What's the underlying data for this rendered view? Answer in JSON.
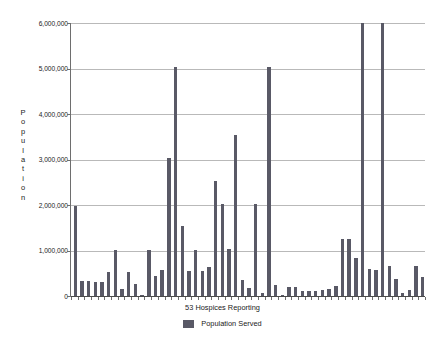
{
  "chart_data": {
    "type": "bar",
    "title": "",
    "subtitle": "",
    "xlabel": "53 Hospices Reporting",
    "ylabel": "Population",
    "ylim": [
      0,
      6000000
    ],
    "ytick_values": [
      0,
      1000000,
      2000000,
      3000000,
      4000000,
      5000000,
      6000000
    ],
    "ytick_labels": [
      "0",
      "1,000,000",
      "2,000,000",
      "3,000,000",
      "4,000,000",
      "5,000,000",
      "6,000,000"
    ],
    "xtick_labels": [],
    "grid": true,
    "legend_position": "bottom-center",
    "bar_color": "#595966",
    "gridline_color": "#b9b9b9",
    "axis_color": "#4a4a4a",
    "series": [
      {
        "name": "Population Served",
        "values": [
          1980000,
          320000,
          320000,
          310000,
          310000,
          520000,
          1010000,
          160000,
          520000,
          260000,
          20000,
          1010000,
          440000,
          580000,
          3030000,
          5030000,
          1530000,
          540000,
          1020000,
          540000,
          630000,
          2530000,
          2030000,
          1030000,
          3530000,
          350000,
          180000,
          2030000,
          60000,
          5040000,
          240000,
          30000,
          190000,
          190000,
          120000,
          110000,
          110000,
          140000,
          150000,
          230000,
          1250000,
          1250000,
          840000,
          6200000,
          590000,
          570000,
          6200000,
          670000,
          370000,
          60000,
          130000,
          650000,
          420000
        ]
      }
    ],
    "categories": [
      "1",
      "2",
      "3",
      "4",
      "5",
      "6",
      "7",
      "8",
      "9",
      "10",
      "11",
      "12",
      "13",
      "14",
      "15",
      "16",
      "17",
      "18",
      "19",
      "20",
      "21",
      "22",
      "23",
      "24",
      "25",
      "26",
      "27",
      "28",
      "29",
      "30",
      "31",
      "32",
      "33",
      "34",
      "35",
      "36",
      "37",
      "38",
      "39",
      "40",
      "41",
      "42",
      "43",
      "44",
      "45",
      "46",
      "47",
      "48",
      "49",
      "50",
      "51",
      "52",
      "53"
    ]
  },
  "legend": {
    "label": "Population Served",
    "swatch_color": "#595966"
  },
  "axis": {
    "x_title": "53 Hospices Reporting",
    "y_title": "Population"
  }
}
